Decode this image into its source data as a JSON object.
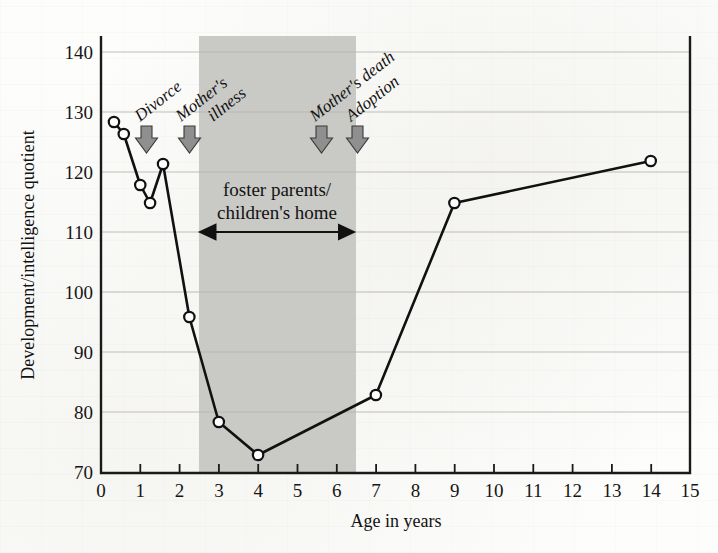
{
  "chart_data": {
    "type": "line",
    "title": "",
    "xlabel": "Age in years",
    "ylabel": "Development/intelligence quotient",
    "xlim": [
      0,
      15
    ],
    "ylim": [
      70,
      144
    ],
    "grid": true,
    "legend": "none",
    "x_ticks": [
      "0",
      "1",
      "2",
      "3",
      "4",
      "5",
      "6",
      "7",
      "8",
      "9",
      "10",
      "11",
      "12",
      "13",
      "14",
      "15"
    ],
    "y_ticks": [
      "70",
      "80",
      "90",
      "100",
      "110",
      "120",
      "130",
      "140"
    ],
    "series": [
      {
        "name": "Development/intelligence quotient",
        "x": [
          0.33,
          0.58,
          1.0,
          1.25,
          1.58,
          2.25,
          3.0,
          4.0,
          7.0,
          9.0,
          14.0
        ],
        "values": [
          128.5,
          126.5,
          118.0,
          115.0,
          121.5,
          96.0,
          78.5,
          73.0,
          83.0,
          115.0,
          122.0
        ]
      }
    ],
    "shaded_region": {
      "label_line1": "foster parents/",
      "label_line2": "children's home",
      "x_start": 2.5,
      "x_end": 6.5,
      "color": "#c9c9c6"
    },
    "annotations": [
      {
        "label": "Divorce",
        "x": 1.17,
        "icon": "down-arrow-icon"
      },
      {
        "label": "Mother's",
        "label2": "illness",
        "x": 2.27,
        "icon": "down-arrow-icon"
      },
      {
        "label": "Mother's death",
        "x": 5.63,
        "icon": "down-arrow-icon"
      },
      {
        "label": "Adoption",
        "x": 6.55,
        "icon": "down-arrow-icon"
      }
    ]
  },
  "labels": {
    "y_axis_title": "Development/intelligence quotient",
    "x_axis_title": "Age in years",
    "band_line1": "foster parents/",
    "band_line2": "children's home",
    "event_divorce": "Divorce",
    "event_mothers_illness_1": "Mother's",
    "event_mothers_illness_2": "illness",
    "event_mothers_death": "Mother's death",
    "event_adoption": "Adoption",
    "y_70": "70",
    "y_80": "80",
    "y_90": "90",
    "y_100": "100",
    "y_110": "110",
    "y_120": "120",
    "y_130": "130",
    "y_140": "140",
    "x_0": "0",
    "x_1": "1",
    "x_2": "2",
    "x_3": "3",
    "x_4": "4",
    "x_5": "5",
    "x_6": "6",
    "x_7": "7",
    "x_8": "8",
    "x_9": "9",
    "x_10": "10",
    "x_11": "11",
    "x_12": "12",
    "x_13": "13",
    "x_14": "14",
    "x_15": "15"
  }
}
